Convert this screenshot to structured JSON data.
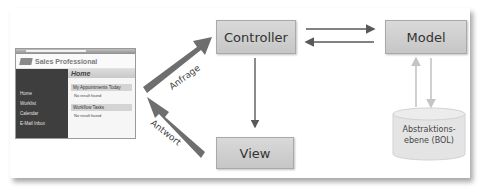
{
  "diagram": {
    "nodes": {
      "controller": {
        "label": "Controller"
      },
      "model": {
        "label": "Model"
      },
      "view": {
        "label": "View"
      },
      "bol": {
        "label_line1": "Abstraktions-",
        "label_line2": "ebene (BOL)"
      }
    },
    "edges": {
      "request": {
        "label": "Anfrage"
      },
      "response": {
        "label": "Antwort"
      }
    },
    "colors": {
      "box_fill": "#cfcfcf",
      "box_border": "#a9a9a9",
      "thick_arrow": "#6e6e6e",
      "thin_arrow": "#595959",
      "light_arrow": "#c8c8c8",
      "cylinder_fill": "#e4e4e4"
    }
  },
  "sap_screenshot": {
    "app_title": "Sales Professional",
    "page_title": "Home",
    "nav_items": [
      "Home",
      "Worklist",
      "Calendar",
      "E-Mail Inbox"
    ],
    "sections": [
      {
        "title": "My Appointments Today",
        "row": "No result found"
      },
      {
        "title": "Workflow Tasks",
        "row": "No result found"
      }
    ]
  }
}
